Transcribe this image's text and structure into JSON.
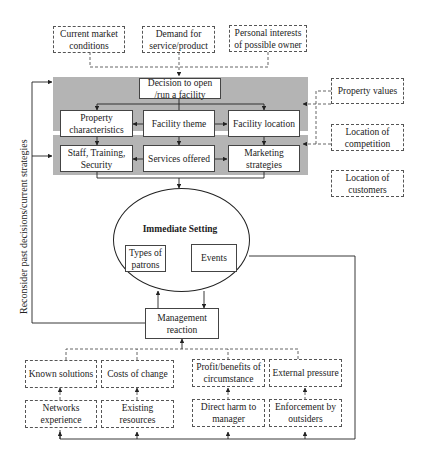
{
  "diagram": {
    "influences_top": [
      {
        "id": "market",
        "label": "Current market conditions"
      },
      {
        "id": "demand",
        "label": "Demand for service/product"
      },
      {
        "id": "interests",
        "label": "Personal interests of possible owner"
      }
    ],
    "decision": {
      "label": "Decision to open /run a facility"
    },
    "tier1": [
      {
        "id": "property",
        "label": "Property characteristics"
      },
      {
        "id": "theme",
        "label": "Facility theme"
      },
      {
        "id": "location",
        "label": "Facility location"
      }
    ],
    "tier2": [
      {
        "id": "staff",
        "label": "Staff, Training, Security"
      },
      {
        "id": "services",
        "label": "Services offered"
      },
      {
        "id": "marketing",
        "label": "Marketing strategies"
      }
    ],
    "influences_right": [
      {
        "id": "property_values",
        "label": "Property values"
      },
      {
        "id": "competition",
        "label": "Location of competition"
      },
      {
        "id": "customers",
        "label": "Location of customers"
      }
    ],
    "immediate_setting": {
      "title": "Immediate Setting",
      "patrons": "Types of patrons",
      "events": "Events"
    },
    "management": {
      "label": "Management reaction"
    },
    "feedback_label": "Reconsider past decisions/current strategies",
    "factors_upper": [
      {
        "id": "known",
        "label": "Known solutions"
      },
      {
        "id": "costs",
        "label": "Costs of change"
      },
      {
        "id": "profit",
        "label": "Profit/benefits of circumstance"
      },
      {
        "id": "external",
        "label": "External pressure"
      }
    ],
    "factors_lower": [
      {
        "id": "networks",
        "label": "Networks experience"
      },
      {
        "id": "resources",
        "label": "Existing resources"
      },
      {
        "id": "harm",
        "label": "Direct harm to manager"
      },
      {
        "id": "enforcement",
        "label": "Enforcement by outsiders"
      }
    ]
  }
}
